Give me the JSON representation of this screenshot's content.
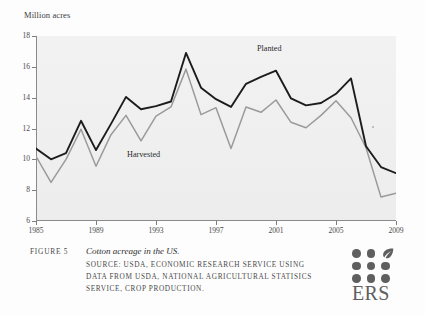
{
  "axis": {
    "y_label": "Million acres",
    "y_ticks": [
      18,
      16,
      14,
      12,
      10,
      8,
      6
    ],
    "x_ticks": [
      1985,
      1989,
      1993,
      1997,
      2001,
      2005,
      2009
    ]
  },
  "series_labels": {
    "planted": "Planted",
    "harvested": "Harvested"
  },
  "caption": {
    "figure_number": "FIGURE 5",
    "title": "Cotton acreage in the US.",
    "source_lines": [
      "SOURCE: USDA, ECONOMIC RESEARCH SERVICE USING",
      "DATA FROM USDA, NATIONAL AGRICULTURAL STATISICS",
      "SERVICE, CROP PRODUCTION."
    ]
  },
  "logo": {
    "text": "ERS",
    "leaf_icon": "leaf-icon",
    "dot_count": 8
  },
  "colors": {
    "planted_line": "#1c1c1c",
    "harvested_line": "#9a9a9a",
    "plot_background": "#eeeeee",
    "axis": "#8a8a8a",
    "text": "#3a3a3a"
  },
  "chart_data": {
    "type": "line",
    "title": "Cotton acreage in the US.",
    "xlabel": "",
    "ylabel": "Million acres",
    "xlim": [
      1985,
      2009
    ],
    "ylim": [
      6,
      18
    ],
    "grid": false,
    "legend": "in-plot labels",
    "x": [
      1985,
      1986,
      1987,
      1988,
      1989,
      1990,
      1991,
      1992,
      1993,
      1994,
      1995,
      1996,
      1997,
      1998,
      1999,
      2000,
      2001,
      2002,
      2003,
      2004,
      2005,
      2006,
      2007,
      2008,
      2009
    ],
    "series": [
      {
        "name": "Planted",
        "color": "#1c1c1c",
        "values": [
          10.7,
          10.0,
          10.4,
          12.5,
          10.6,
          12.3,
          14.05,
          13.25,
          13.45,
          13.75,
          16.9,
          14.65,
          13.9,
          13.4,
          14.9,
          15.35,
          15.75,
          13.95,
          13.5,
          13.65,
          14.25,
          15.25,
          10.85,
          9.5,
          9.1
        ]
      },
      {
        "name": "Harvested",
        "color": "#9a9a9a",
        "values": [
          10.2,
          8.5,
          10.0,
          11.95,
          9.55,
          11.6,
          12.85,
          11.2,
          12.8,
          13.4,
          15.85,
          12.9,
          13.35,
          10.7,
          13.4,
          13.05,
          13.85,
          12.4,
          12.05,
          12.85,
          13.8,
          12.7,
          10.75,
          7.55,
          7.8
        ]
      }
    ]
  }
}
